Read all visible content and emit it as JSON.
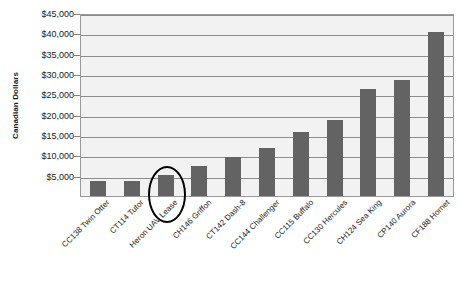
{
  "chart_data": {
    "type": "bar",
    "title": "",
    "xlabel": "",
    "ylabel": "Canadian Dollars",
    "ylim": [
      0,
      45000
    ],
    "grid": true,
    "legend": "none",
    "y_ticks": [
      "$5,000",
      "$10,000",
      "$15,000",
      "$20,000",
      "$25,000",
      "$30,000",
      "$35,000",
      "$40,000",
      "$45,000"
    ],
    "y_tick_values": [
      5000,
      10000,
      15000,
      20000,
      25000,
      30000,
      35000,
      40000,
      45000
    ],
    "categories": [
      "CC138 Twin Otter",
      "CT114 Tutor",
      "Heron UAV Lease",
      "CH146 Griffon",
      "CT142 Dash-8",
      "CC144 Challenger",
      "CC115 Buffalo",
      "CC130 Hercules",
      "CH124 Sea King",
      "CP140 Aurora",
      "CF188 Hornet"
    ],
    "values": [
      3700,
      3800,
      5200,
      7500,
      9700,
      11800,
      15800,
      18700,
      26300,
      28500,
      40300
    ],
    "annotations": [
      {
        "type": "ellipse",
        "target_category": "Heron UAV Lease",
        "color": "#000000"
      }
    ],
    "colors": {
      "bar": "#636363",
      "plot_background": "#f2f2f2",
      "gridline": "#8c8c8c",
      "axis": "#9a9a9a",
      "text": "#1a1a1a",
      "annotation": "#000000"
    }
  }
}
